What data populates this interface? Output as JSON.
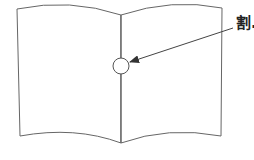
{
  "diagram": {
    "type": "open-book-illustration",
    "callout_label": "割.",
    "colors": {
      "stroke": "#555555",
      "arrow": "#333333",
      "text": "#222222",
      "background": "#ffffff"
    },
    "elements": {
      "left_page": "left page of open book",
      "right_page": "right page of open book",
      "spine": "center spine/gutter line",
      "marker_circle": "circle marking a point on the spine",
      "arrow": "arrow pointing from label to circle"
    }
  }
}
